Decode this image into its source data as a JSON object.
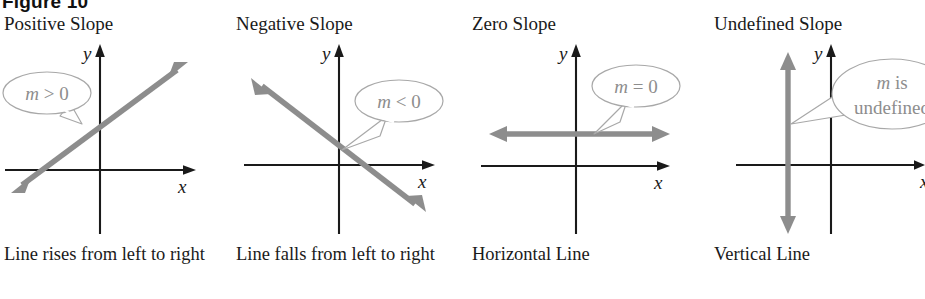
{
  "figure": {
    "header": "Figure 10",
    "background_color": "#ffffff",
    "axis_color": "#1a1a1a",
    "line_color": "#8d8d8d",
    "callout_stroke_color": "#a8a8a8",
    "callout_text_color": "#8d8d8d",
    "text_color": "#1a1a1a"
  },
  "panels": [
    {
      "id": "positive-slope",
      "title": "Positive Slope",
      "callout": "m > 0",
      "callout_var": "m",
      "callout_rest": " > 0",
      "caption": "Line rises from left to right",
      "x_axis_label": "x",
      "y_axis_label": "y",
      "line_type": "rising-diagonal"
    },
    {
      "id": "negative-slope",
      "title": "Negative Slope",
      "callout": "m < 0",
      "callout_var": "m",
      "callout_rest": " < 0",
      "caption": "Line falls from left to right",
      "x_axis_label": "x",
      "y_axis_label": "y",
      "line_type": "falling-diagonal"
    },
    {
      "id": "zero-slope",
      "title": "Zero Slope",
      "callout": "m = 0",
      "callout_var": "m",
      "callout_rest": " = 0",
      "caption": "Horizontal Line",
      "x_axis_label": "x",
      "y_axis_label": "y",
      "line_type": "horizontal"
    },
    {
      "id": "undefined-slope",
      "title": "Undefined Slope",
      "callout": "m is undefined",
      "callout_var": "m",
      "callout_rest": " is",
      "callout_line2": "undefined",
      "caption": "Vertical Line",
      "x_axis_label": "x",
      "y_axis_label": "y",
      "line_type": "vertical"
    }
  ]
}
